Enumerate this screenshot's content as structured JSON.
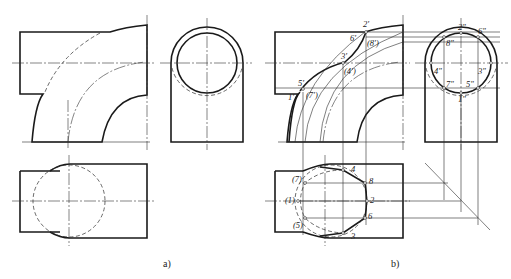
{
  "figure": {
    "panel_a": {
      "caption": "a)"
    },
    "panel_b": {
      "caption": "b)",
      "front_labels": [
        "2'",
        "6'",
        "(8')",
        "3'",
        "(4')",
        "5'",
        "(7')",
        "1'"
      ],
      "side_labels": [
        "2\"",
        "6\"",
        "8\"",
        "4\"",
        "3\"",
        "7\"",
        "5\"",
        "1\""
      ],
      "top_labels": [
        "4",
        "8",
        "2",
        "6",
        "3",
        "(7)",
        "(1)",
        "(5)"
      ]
    }
  },
  "colors": {
    "line": "#1a1a1a",
    "background": "#ffffff"
  }
}
